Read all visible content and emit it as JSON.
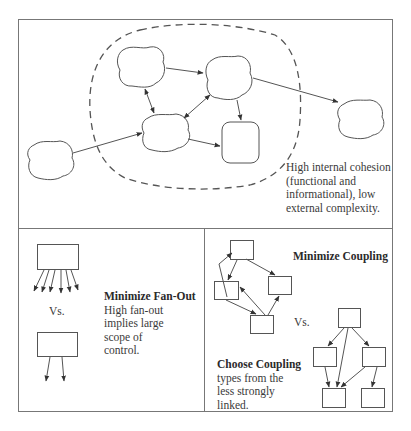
{
  "figure": {
    "panels": [
      {
        "id": "cohesion",
        "caption_lines": [
          "High internal cohesion",
          "(functional and",
          "informational), low",
          "external complexity."
        ]
      },
      {
        "id": "fan-out",
        "heading": "Minimize Fan-Out",
        "body_lines": [
          "High fan-out",
          "implies large",
          "scope of",
          "control."
        ],
        "vs_label": "Vs."
      },
      {
        "id": "coupling",
        "heading_top": "Minimize Coupling",
        "vs_label": "Vs.",
        "heading_bottom": "Choose Coupling",
        "body_lines": [
          "types from the",
          "less strongly",
          "linked."
        ]
      }
    ],
    "colors": {
      "stroke": "#555555",
      "frame": "#777777",
      "text": "#3a3a3a",
      "background": "#ffffff"
    }
  }
}
